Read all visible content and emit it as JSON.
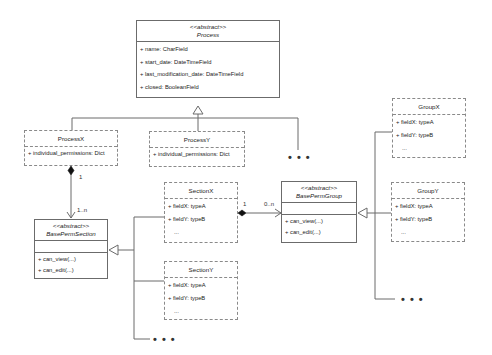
{
  "diagram": {
    "type": "UML class diagram",
    "classes": {
      "process": {
        "stereotype": "<<abstract>>",
        "name": "Process",
        "attributes": [
          "+ name: CharField",
          "+ start_date: DateTimeField",
          "+ last_modification_date: DateTimeField",
          "+ closed: BooleanField"
        ]
      },
      "process_x": {
        "name": "ProcessX",
        "attributes": [
          "+ individual_permissions: Dict"
        ]
      },
      "process_y": {
        "name": "ProcessY",
        "attributes": [
          "+ individual_permissions: Dict"
        ]
      },
      "base_perm_section": {
        "stereotype": "<<abstract>>",
        "name": "BasePermSection",
        "methods": [
          "+ can_view(...)",
          "+ can_edit(...)"
        ]
      },
      "section_x": {
        "name": "SectionX",
        "attributes": [
          "+ fieldX: typeA",
          "+ fieldY: typeB",
          "..."
        ]
      },
      "section_y": {
        "name": "SectionY",
        "attributes": [
          "+ fieldX: typeA",
          "+ fieldY: typeB",
          "..."
        ]
      },
      "base_perm_group": {
        "stereotype": "<<abstract>>",
        "name": "BasePermGroup",
        "methods": [
          "+ can_view(...)",
          "+ can_edit(...)"
        ]
      },
      "group_x": {
        "name": "GroupX",
        "attributes": [
          "+ fieldX: typeA",
          "+ fieldY: typeB",
          "..."
        ]
      },
      "group_y": {
        "name": "GroupY",
        "attributes": [
          "+ fieldX: typeA",
          "+ fieldY: typeB",
          "..."
        ]
      }
    },
    "multiplicities": {
      "processx_to_section_source": "1",
      "processx_to_section_target": "1..n",
      "section_to_group_source": "1",
      "section_to_group_target": "0..n"
    },
    "ellipsis": "• • •",
    "colors": {
      "line": "#6b6b6b",
      "dashed_border": "#8a8a8a",
      "background": "#ffffff"
    }
  }
}
